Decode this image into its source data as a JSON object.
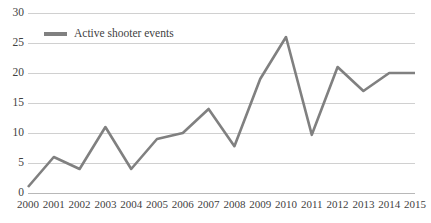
{
  "chart_data": {
    "type": "line",
    "title": "",
    "subtitle": "",
    "xlabel": "",
    "ylabel": "",
    "categories": [
      "2000",
      "2001",
      "2002",
      "2003",
      "2004",
      "2005",
      "2006",
      "2007",
      "2008",
      "2009",
      "2010",
      "2011",
      "2012",
      "2013",
      "2014",
      "2015"
    ],
    "series": [
      {
        "name": "Active shooter events",
        "color": "#808080",
        "values": [
          1,
          6,
          4,
          11,
          4,
          9,
          10,
          14,
          7.8,
          19,
          26,
          9.7,
          21,
          17,
          20,
          20
        ]
      }
    ],
    "ylim": [
      0,
      30
    ],
    "ytick_step": 5,
    "yticks": [
      "30",
      "25",
      "20",
      "15",
      "10",
      "5",
      "0"
    ],
    "ytick_values": [
      30,
      25,
      20,
      15,
      10,
      5,
      0
    ],
    "xlim_labels": [
      "2000",
      "2015"
    ],
    "grid": "horizontal",
    "legend_position": "top-left",
    "legend_entries": [
      "Active shooter events"
    ]
  },
  "legend": {
    "label": "Active shooter events",
    "swatch_color": "#808080"
  },
  "axes": {
    "grid_color": "#d0d0d0",
    "zero_axis_color": "#b8b8b8",
    "tick_text_color": "#3f3f3f"
  }
}
